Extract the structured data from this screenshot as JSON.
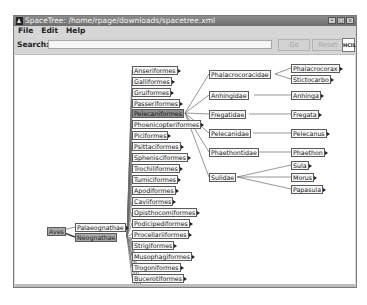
{
  "window": {
    "title": "SpaceTree: /home/rpage/downloads/spacetree.xml",
    "controls": [
      "minimize",
      "maximize",
      "close"
    ]
  },
  "menu": {
    "items": [
      "File",
      "Edit",
      "Help"
    ]
  },
  "search": {
    "label": "Search:",
    "value": "",
    "go_label": "Go",
    "reset_label": "Reset",
    "logo": "HCIL"
  },
  "tree": {
    "root": "Aves",
    "level1": [
      "Palaeognathae",
      "Neognathae"
    ],
    "level1_selected": "Neognathae",
    "level2": [
      "Anseriformes",
      "Galliformes",
      "Gruiformes",
      "Passeriformes",
      "Pelecaniformes",
      "Phoenicopteriformes",
      "Piciformes",
      "Psittaciformes",
      "Sphenisciformes",
      "Trochiliformes",
      "Turniciformes",
      "Apodiformes",
      "Caviiformes",
      "Opisthocomiformes",
      "Podicipediformes",
      "Procellariiformes",
      "Strigiformes",
      "Musophagiformes",
      "Trogoniformes",
      "Bucerotiformes"
    ],
    "level2_selected": "Pelecaniformes",
    "level3": [
      "Phalacrocoracidae",
      "Anhingidae",
      "Fregatidae",
      "Pelecanidae",
      "Phaethontidae",
      "Sulidae"
    ],
    "level4": {
      "Phalacrocoracidae": [
        "Phalacrocorax",
        "Stictocarbo"
      ],
      "Anhingidae": [
        "Anhinga"
      ],
      "Fregatidae": [
        "Fregata"
      ],
      "Pelecanidae": [
        "Pelecanus"
      ],
      "Phaethontidae": [
        "Phaethon"
      ],
      "Sulidae": [
        "Sula",
        "Morus",
        "Papasula"
      ]
    }
  }
}
